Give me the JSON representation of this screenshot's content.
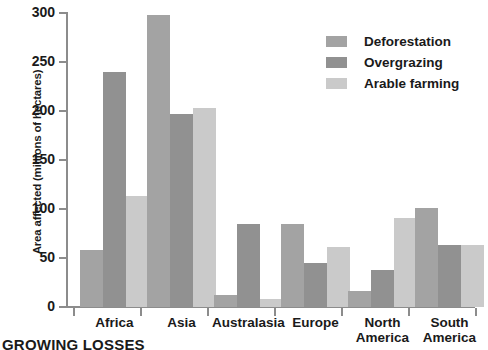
{
  "chart_data": {
    "type": "bar",
    "title": "",
    "xlabel": "",
    "ylabel": "Area affected (millions of hectares)",
    "ylim": [
      0,
      300
    ],
    "yticks": [
      0,
      50,
      100,
      150,
      200,
      250,
      300
    ],
    "ytick_labels": [
      "0",
      "50",
      "100",
      "150",
      "200",
      "250",
      "300"
    ],
    "grid": false,
    "legend_position": "top-right",
    "categories": [
      "Africa",
      "Asia",
      "Australasia",
      "Europe",
      "North America",
      "South America"
    ],
    "category_lines": [
      [
        "Africa"
      ],
      [
        "Asia"
      ],
      [
        "Australasia"
      ],
      [
        "Europe"
      ],
      [
        "North",
        "America"
      ],
      [
        "South",
        "America"
      ]
    ],
    "series": [
      {
        "name": "Deforestation",
        "color": "#a3a3a3",
        "values": [
          58,
          298,
          12,
          85,
          16,
          101
        ]
      },
      {
        "name": "Overgrazing",
        "color": "#919191",
        "values": [
          240,
          197,
          85,
          45,
          38,
          63
        ]
      },
      {
        "name": "Arable farming",
        "color": "#cacaca",
        "values": [
          113,
          203,
          8,
          61,
          91,
          63
        ]
      }
    ]
  },
  "caption": {
    "text": "GROWING LOSSES"
  },
  "axis": {
    "line_color": "#8c8c8c"
  }
}
